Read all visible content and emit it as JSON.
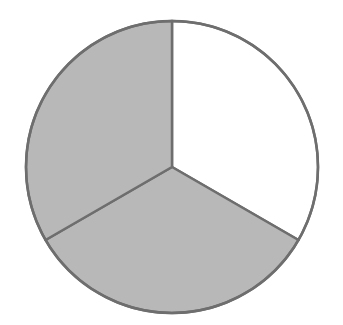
{
  "figure": {
    "width": 343,
    "height": 325,
    "background_color": "#FFFFFF",
    "title": "",
    "caption": ""
  },
  "geometry": {
    "center_x": 172,
    "center_y": 167,
    "radius": 146,
    "start_angle_deg": 90,
    "direction": "counterclockwise"
  },
  "style": {
    "stroke_color": "#6E6E6E",
    "stroke_width": 2.5,
    "shaded_fill": "#B8B8B8",
    "unshaded_fill": "#FFFFFF"
  },
  "chart_data": {
    "type": "pie",
    "title": "",
    "subtitle": "",
    "xlabel": "",
    "ylabel": "",
    "grid": false,
    "legend": false,
    "legend_position": "none",
    "total_slices": 3,
    "categories": [
      "Slice 1",
      "Slice 2",
      "Slice 3"
    ],
    "values": [
      1,
      1,
      1
    ],
    "percentages": [
      33.3,
      33.3,
      33.3
    ],
    "angles_deg": [
      120,
      120,
      120
    ],
    "fills": [
      "#FFFFFF",
      "#B8B8B8",
      "#B8B8B8"
    ],
    "shaded": [
      false,
      true,
      true
    ],
    "annotations": [],
    "tick_labels": [],
    "data_labels": [],
    "slices": [
      {
        "name": "top-right-slice",
        "label": "",
        "value": 1,
        "fraction": "1/3",
        "percent": 33.3,
        "start_angle_deg": 90,
        "end_angle_deg": -30,
        "sweep_deg": 120,
        "fill": "#FFFFFF",
        "shaded": false
      },
      {
        "name": "bottom-slice",
        "label": "",
        "value": 1,
        "fraction": "1/3",
        "percent": 33.3,
        "start_angle_deg": -30,
        "end_angle_deg": -150,
        "sweep_deg": 120,
        "fill": "#B8B8B8",
        "shaded": true
      },
      {
        "name": "left-slice",
        "label": "",
        "value": 1,
        "fraction": "1/3",
        "percent": 33.3,
        "start_angle_deg": -150,
        "end_angle_deg": 90,
        "sweep_deg": 120,
        "fill": "#B8B8B8",
        "shaded": true
      }
    ]
  }
}
